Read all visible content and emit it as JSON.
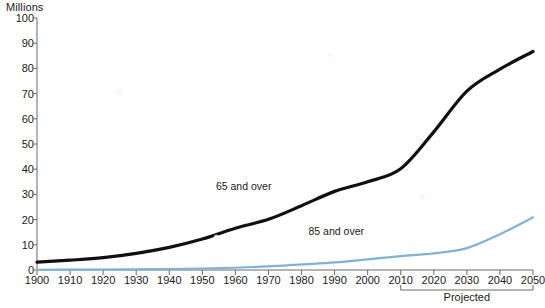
{
  "chart_data": {
    "type": "line",
    "title": "",
    "ylabel": "Millions",
    "xlabel": "",
    "ylim": [
      0,
      100
    ],
    "xlim": [
      1900,
      2050
    ],
    "grid": false,
    "legend_position": "inline-annotation",
    "yticks": [
      0,
      10,
      20,
      30,
      40,
      50,
      60,
      70,
      80,
      90,
      100
    ],
    "ytick_labels": [
      "0",
      "10",
      "20",
      "30",
      "40",
      "50",
      "60",
      "70",
      "80",
      "90",
      "100"
    ],
    "x": [
      1900,
      1910,
      1920,
      1930,
      1940,
      1950,
      1960,
      1970,
      1980,
      1990,
      2000,
      2010,
      2020,
      2030,
      2040,
      2050
    ],
    "xtick_labels": [
      "1900",
      "1910",
      "1920",
      "1930",
      "1940",
      "1950",
      "1960",
      "1970",
      "1980",
      "1990",
      "2000",
      "2010",
      "2020",
      "2030",
      "2040",
      "2050"
    ],
    "series": [
      {
        "name": "65 and over",
        "color": "#101010",
        "values": [
          3.1,
          3.9,
          4.9,
          6.6,
          9.0,
          12.3,
          16.6,
          20.1,
          25.5,
          31.2,
          35.0,
          40.2,
          54.8,
          71.0,
          79.7,
          86.7
        ]
      },
      {
        "name": "85 and over",
        "color": "#7FB3D5",
        "values": [
          0.1,
          0.2,
          0.2,
          0.3,
          0.4,
          0.6,
          0.9,
          1.4,
          2.2,
          3.0,
          4.2,
          5.5,
          6.6,
          8.7,
          14.2,
          20.9
        ]
      }
    ],
    "annotations": [
      {
        "text": "65 and over",
        "x": 1965,
        "y": 33
      },
      {
        "text": "85 and over",
        "x": 1993,
        "y": 15
      },
      {
        "text": "Projected",
        "x_start": 2010,
        "x_end": 2050
      }
    ]
  },
  "labels": {
    "y_axis_title": "Millions",
    "series_65": "65 and over",
    "series_85": "85 and over",
    "projected": "Projected"
  }
}
